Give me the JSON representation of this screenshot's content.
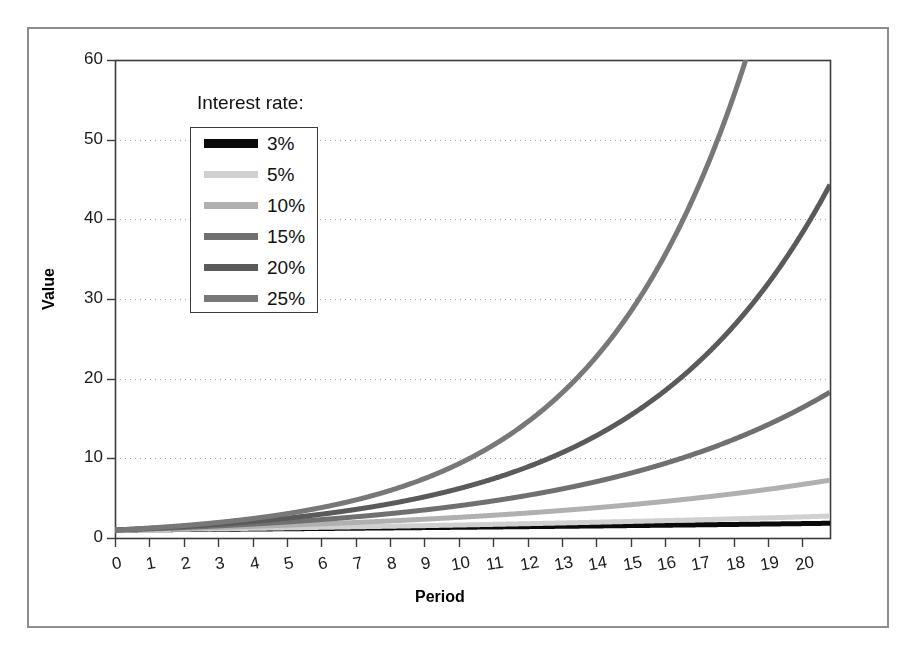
{
  "chart_data": {
    "type": "line",
    "title": "",
    "xlabel": "Period",
    "ylabel": "Value",
    "xlim": [
      0,
      20.8
    ],
    "ylim": [
      0,
      60
    ],
    "grid": true,
    "grid_axis": "y",
    "grid_style": "dotted",
    "legend_title": "Interest rate:",
    "legend_position": "upper-left-inside",
    "xticks": [
      "0",
      "1",
      "2",
      "3",
      "4",
      "5",
      "6",
      "7",
      "8",
      "9",
      "10",
      "11",
      "12",
      "13",
      "14",
      "15",
      "16",
      "17",
      "18",
      "19",
      "20"
    ],
    "xtick_values": [
      0,
      1,
      2,
      3,
      4,
      5,
      6,
      7,
      8,
      9,
      10,
      11,
      12,
      13,
      14,
      15,
      16,
      17,
      18,
      19,
      20
    ],
    "yticks": [
      "0",
      "10",
      "20",
      "30",
      "40",
      "50",
      "60"
    ],
    "ytick_values": [
      0,
      10,
      20,
      30,
      40,
      50,
      60
    ],
    "x": [
      0,
      1,
      2,
      3,
      4,
      5,
      6,
      7,
      8,
      9,
      10,
      11,
      12,
      13,
      14,
      15,
      16,
      17,
      18,
      19,
      20
    ],
    "series": [
      {
        "name": "3%",
        "rate": 0.03,
        "color": "#0a0a0a",
        "width": 5,
        "values": [
          1.0,
          1.03,
          1.06,
          1.09,
          1.13,
          1.16,
          1.19,
          1.23,
          1.27,
          1.3,
          1.34,
          1.38,
          1.43,
          1.47,
          1.51,
          1.56,
          1.6,
          1.65,
          1.7,
          1.75,
          1.81
        ]
      },
      {
        "name": "5%",
        "rate": 0.05,
        "color": "#d0d0d0",
        "width": 5,
        "values": [
          1.0,
          1.05,
          1.1,
          1.16,
          1.22,
          1.28,
          1.34,
          1.41,
          1.48,
          1.55,
          1.63,
          1.71,
          1.8,
          1.89,
          1.98,
          2.08,
          2.18,
          2.29,
          2.41,
          2.53,
          2.65
        ]
      },
      {
        "name": "10%",
        "rate": 0.1,
        "color": "#b0b0b0",
        "width": 5,
        "values": [
          1.0,
          1.1,
          1.21,
          1.33,
          1.46,
          1.61,
          1.77,
          1.95,
          2.14,
          2.36,
          2.59,
          2.85,
          3.14,
          3.45,
          3.8,
          4.18,
          4.59,
          5.05,
          5.56,
          6.12,
          6.73
        ]
      },
      {
        "name": "15%",
        "rate": 0.15,
        "color": "#707070",
        "width": 5,
        "values": [
          1.0,
          1.15,
          1.32,
          1.52,
          1.75,
          2.01,
          2.31,
          2.66,
          3.06,
          3.52,
          4.05,
          4.65,
          5.35,
          6.15,
          7.08,
          8.14,
          9.36,
          10.76,
          12.38,
          14.23,
          16.37
        ]
      },
      {
        "name": "20%",
        "rate": 0.2,
        "color": "#5a5a5a",
        "width": 5,
        "values": [
          1.0,
          1.2,
          1.44,
          1.73,
          2.07,
          2.49,
          2.99,
          3.58,
          4.3,
          5.16,
          6.19,
          7.43,
          8.92,
          10.7,
          12.84,
          15.41,
          18.49,
          22.19,
          26.62,
          31.95,
          38.34
        ]
      },
      {
        "name": "25%",
        "rate": 0.25,
        "color": "#787878",
        "width": 5,
        "values": [
          1.0,
          1.25,
          1.56,
          1.95,
          2.44,
          3.05,
          3.81,
          4.77,
          5.96,
          7.45,
          9.31,
          11.64,
          14.55,
          18.19,
          22.74,
          28.42,
          35.53,
          44.41,
          55.51,
          69.39,
          86.74
        ]
      }
    ]
  },
  "figure": {
    "frame_color": "#8d8d8d",
    "plot_border_color": "#3b3b3b",
    "background": "#ffffff"
  }
}
